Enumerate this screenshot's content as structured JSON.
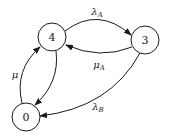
{
  "diagram": {
    "type": "state-transition-graph",
    "nodes": [
      {
        "id": "4",
        "label": "4",
        "cx": 52,
        "cy": 37,
        "r": 14
      },
      {
        "id": "3",
        "label": "3",
        "cx": 145,
        "cy": 40,
        "r": 14
      },
      {
        "id": "0",
        "label": "0",
        "cx": 26,
        "cy": 117,
        "r": 14
      }
    ],
    "edges": [
      {
        "from": "4",
        "to": "3",
        "label_main": "λ",
        "label_sub": "A"
      },
      {
        "from": "3",
        "to": "4",
        "label_main": "μ",
        "label_sub": "A"
      },
      {
        "from": "0",
        "to": "4",
        "label_main": "μ",
        "label_sub": ""
      },
      {
        "from": "4",
        "to": "0",
        "label_main": "",
        "label_sub": ""
      },
      {
        "from": "3",
        "to": "0",
        "label_main": "λ",
        "label_sub": "B"
      }
    ],
    "colors": {
      "stroke": "#1a1a1a",
      "background": "#ffffff"
    }
  }
}
